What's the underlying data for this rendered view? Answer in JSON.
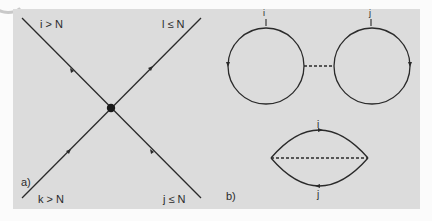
{
  "figure": {
    "panel_a": {
      "label": "a)",
      "legs": [
        {
          "id": "top-left",
          "text": "i > N"
        },
        {
          "id": "top-right",
          "text": "l ≤ N"
        },
        {
          "id": "bottom-left",
          "text": "k > N"
        },
        {
          "id": "bottom-right",
          "text": "j ≤ N"
        }
      ],
      "vertex": "filled-dot"
    },
    "panel_b": {
      "label": "b)",
      "dumbbell": {
        "left_loop_label": "i",
        "right_loop_label": "j",
        "connector": "dashed"
      },
      "lens": {
        "top_label": "i",
        "bottom_label": "j",
        "chord": "dashed"
      }
    },
    "colors": {
      "panel_bg": "#dcdcdc",
      "line": "#2a2a2a"
    }
  }
}
